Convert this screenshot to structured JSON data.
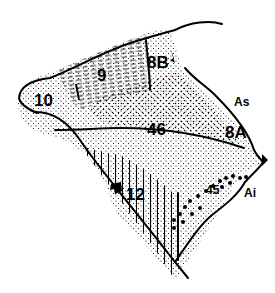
{
  "diagram": {
    "type": "brain-area-map",
    "colors": {
      "outline": "#000000",
      "background": "#ffffff",
      "stipple": "#000000"
    },
    "areas": [
      {
        "id": "10",
        "label": "10",
        "texture": "fine-stipple"
      },
      {
        "id": "9",
        "label": "9",
        "texture": "horizontal-dashes"
      },
      {
        "id": "8B",
        "label": "8B",
        "texture": "fine-stipple"
      },
      {
        "id": "46",
        "label": "46",
        "texture": "medium-stipple"
      },
      {
        "id": "8A",
        "label": "8A",
        "texture": "fine-stipple"
      },
      {
        "id": "12",
        "label": "12",
        "texture": "vertical-lines"
      },
      {
        "id": "45",
        "label": "45",
        "texture": "large-dots"
      }
    ],
    "sulci": [
      {
        "id": "As",
        "label": "As"
      },
      {
        "id": "Ai",
        "label": "Ai"
      }
    ],
    "markers": [
      {
        "id": "marker-8B",
        "shape": "black-arrowhead"
      },
      {
        "id": "marker-12",
        "shape": "black-star"
      },
      {
        "id": "marker-arcuate",
        "shape": "black-triangle"
      },
      {
        "id": "marker-9",
        "shape": "black-slash"
      }
    ]
  }
}
